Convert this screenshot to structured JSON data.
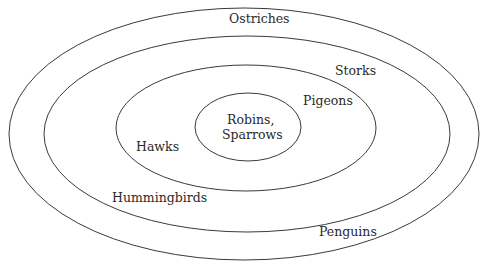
{
  "diagram": {
    "type": "nested-ellipses",
    "stroke_color": "#3a3a3a",
    "text_color": "#2a2a2a",
    "rings": [
      {
        "name": "outer",
        "cx": 244,
        "cy": 134,
        "rx": 235,
        "ry": 126
      },
      {
        "name": "second",
        "cx": 247,
        "cy": 134,
        "rx": 203,
        "ry": 98
      },
      {
        "name": "third",
        "cx": 246,
        "cy": 128,
        "rx": 130,
        "ry": 63
      },
      {
        "name": "inner",
        "cx": 248,
        "cy": 127,
        "rx": 53,
        "ry": 34
      }
    ],
    "labels": {
      "ostriches": "Ostriches",
      "storks": "Storks",
      "pigeons": "Pigeons",
      "robins_line1": "Robins,",
      "robins_line2": "Sparrows",
      "hawks": "Hawks",
      "hummingbirds": "Hummingbirds",
      "penguins": "Penguins"
    }
  }
}
